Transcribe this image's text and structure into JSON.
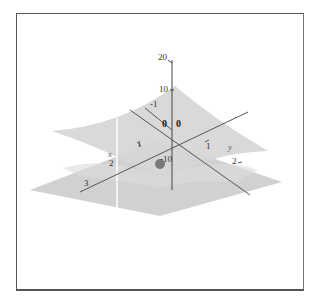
{
  "figure": {
    "type": "3d-surface-plot",
    "axes": {
      "z": {
        "ticks": [
          "20",
          "10",
          "-10"
        ]
      },
      "x": {
        "label": "x",
        "ticks": [
          "-1",
          "0",
          "1",
          "2",
          "3"
        ]
      },
      "y": {
        "label": "y",
        "ticks": [
          "0",
          "1",
          "2"
        ]
      }
    },
    "labels": {
      "z20": "20",
      "z10": "10",
      "zneg10": "-10",
      "xneg1": "-1",
      "x0": "0",
      "y0": "0",
      "x1": "1",
      "x2": "2",
      "x3": "3",
      "xname": "x",
      "y1": "1",
      "y2": "2",
      "yname": "y"
    },
    "surfaces": [
      {
        "name": "upper-curved-surface",
        "color": "#d2d2d2"
      },
      {
        "name": "lower-plane",
        "color": "#cfcfcf"
      }
    ],
    "point": {
      "color": "#7a7a7a"
    }
  }
}
